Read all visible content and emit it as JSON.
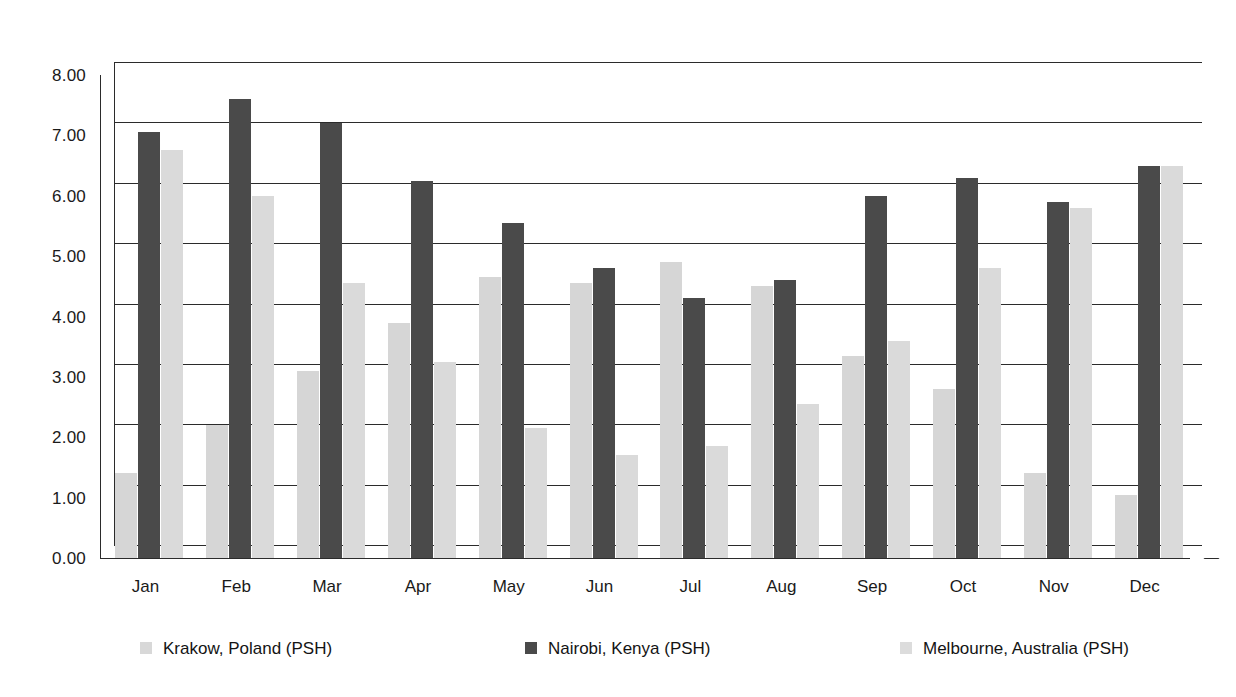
{
  "chart_data": {
    "type": "bar",
    "title": "",
    "subtitle": "",
    "xlabel": "",
    "ylabel": "",
    "categories": [
      "Jan",
      "Feb",
      "Mar",
      "Apr",
      "May",
      "Jun",
      "Jul",
      "Aug",
      "Sep",
      "Oct",
      "Nov",
      "Dec"
    ],
    "series": [
      {
        "name": "Krakow, Poland (PSH)",
        "color": "#d6d6d6",
        "values": [
          1.4,
          2.2,
          3.1,
          3.9,
          4.65,
          4.55,
          4.9,
          4.5,
          3.35,
          2.8,
          1.4,
          1.05
        ]
      },
      {
        "name": "Nairobi, Kenya (PSH)",
        "color": "#4a4a4a",
        "values": [
          7.05,
          7.6,
          7.2,
          6.25,
          5.55,
          4.8,
          4.3,
          4.6,
          6.0,
          6.3,
          5.9,
          6.5
        ]
      },
      {
        "name": "Melbourne, Australia (PSH)",
        "color": "#dadada",
        "values": [
          6.75,
          6.0,
          4.55,
          3.25,
          2.15,
          1.7,
          1.85,
          2.55,
          3.6,
          4.8,
          5.8,
          6.5
        ]
      }
    ],
    "ylim": [
      0,
      8
    ],
    "ytick_step": 1,
    "ytick_labels": [
      "0.00",
      "1.00",
      "2.00",
      "3.00",
      "4.00",
      "5.00",
      "6.00",
      "7.00",
      "8.00"
    ],
    "grid": true,
    "legend_position": "bottom",
    "style": "3d-clustered-column"
  },
  "axes": {
    "y_ticks": [
      "8.00",
      "7.00",
      "6.00",
      "5.00",
      "4.00",
      "3.00",
      "2.00",
      "1.00",
      "0.00"
    ],
    "x_ticks": [
      "Jan",
      "Feb",
      "Mar",
      "Apr",
      "May",
      "Jun",
      "Jul",
      "Aug",
      "Sep",
      "Oct",
      "Nov",
      "Dec"
    ]
  },
  "legend": {
    "items": [
      {
        "label": "Krakow, Poland (PSH)",
        "swatch": "krakow"
      },
      {
        "label": "Nairobi, Kenya (PSH)",
        "swatch": "nairobi"
      },
      {
        "label": "Melbourne, Australia (PSH)",
        "swatch": "melbourne"
      }
    ]
  },
  "caption": {
    "fragment": ""
  }
}
